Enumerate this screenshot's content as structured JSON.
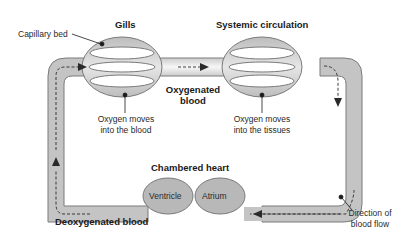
{
  "diagram": {
    "colors": {
      "tube_fill": "#c4c4c4",
      "tube_edge": "#7a7a7a",
      "oxygenated_highlight": "#f2f2f2",
      "heart_fill": "#b8b8b8",
      "text": "#1a1a1a",
      "arrow": "#2a2a2a"
    },
    "labels": {
      "gills": "Gills",
      "systemic": "Systemic circulation",
      "capillary_bed": "Capillary bed",
      "oxygenated_line1": "Oxygenated",
      "oxygenated_line2": "blood",
      "oxygen_blood_line1": "Oxygen moves",
      "oxygen_blood_line2": "into the blood",
      "oxygen_tissues_line1": "Oxygen moves",
      "oxygen_tissues_line2": "into the tissues",
      "chambered_heart": "Chambered heart",
      "ventricle": "Ventricle",
      "atrium": "Atrium",
      "deoxygenated": "Deoxygenated blood",
      "direction_line1": "Direction of",
      "direction_line2": "blood flow"
    },
    "flow_arrows": [
      {
        "location": "left-top-corner",
        "direction": "right"
      },
      {
        "location": "between-capillary-beds",
        "direction": "right"
      },
      {
        "location": "right-top-corner",
        "direction": "down"
      },
      {
        "location": "bottom-right",
        "direction": "left"
      },
      {
        "location": "left-bottom-corner",
        "direction": "up"
      }
    ]
  }
}
